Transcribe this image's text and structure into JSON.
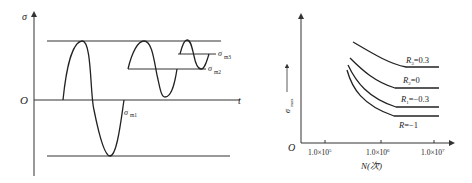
{
  "left_diagram": {
    "y_axis_label": "σ",
    "x_axis_label": "t",
    "origin_label": "O",
    "mean_labels": [
      {
        "base": "σ",
        "sub": "m1"
      },
      {
        "base": "σ",
        "sub": "m2"
      },
      {
        "base": "σ",
        "sub": "m3"
      }
    ]
  },
  "right_diagram": {
    "y_axis_label": "σ",
    "y_axis_sub": "max",
    "origin_label": "O",
    "x_axis_label": "N(次)",
    "x_ticks": [
      {
        "mant": "1.0×10",
        "exp": "5"
      },
      {
        "mant": "1.0×10",
        "exp": "6"
      },
      {
        "mant": "1.0×10",
        "exp": "7"
      }
    ],
    "curves": [
      {
        "base": "R",
        "sub": "3",
        "value": "=0.3"
      },
      {
        "base": "R",
        "sub": "2",
        "value": "=0"
      },
      {
        "base": "R",
        "sub": "1",
        "value": "=−0.3"
      },
      {
        "base": "R",
        "sub": "",
        "value": "=−1"
      }
    ]
  },
  "colors": {
    "line": "#333333",
    "text": "#222222"
  }
}
